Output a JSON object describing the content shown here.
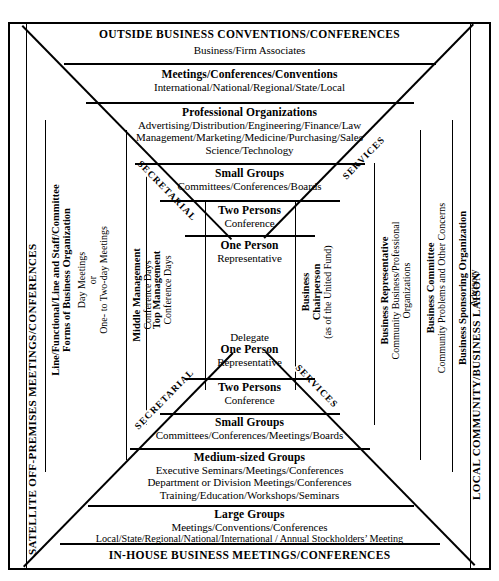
{
  "diagram": {
    "title_top": "OUTSIDE BUSINESS CONVENTIONS/CONFERENCES",
    "title_bottom": "IN-HOUSE BUSINESS MEETINGS/CONFERENCES",
    "side_left": "SATELLITE  OFF-PREMISES MEETINGS/CONFERENCES",
    "side_right": "LOCAL COMMUNITY/BUSINESS LAISON",
    "diagonal_labels": {
      "upper_left": "SECRETARIAL",
      "upper_right": "SERVICES",
      "lower_left": "SECRETARIAL",
      "lower_right": "SERVICES"
    },
    "top_tiers": [
      {
        "heading": "",
        "lines": [
          "Business/Firm  Associates"
        ]
      },
      {
        "heading": "Meetings/Conferences/Conventions",
        "lines": [
          "International/National/Regional/State/Local"
        ]
      },
      {
        "heading": "Professional Organizations",
        "lines": [
          "Advertising/Distribution/Engineering/Finance/Law",
          "Management/Marketing/Medicine/Purchasing/Sales",
          "Science/Technology"
        ]
      },
      {
        "heading": "Small Groups",
        "lines": [
          "Committees/Conferences/Boards"
        ]
      },
      {
        "heading": "Two Persons",
        "lines": [
          "Conference"
        ]
      },
      {
        "heading": "One Person",
        "lines": [
          "Representative"
        ]
      }
    ],
    "bottom_tiers": [
      {
        "heading": "One Person",
        "lines": [
          "Delegate",
          "Representative"
        ]
      },
      {
        "heading": "Two Persons",
        "lines": [
          "Conference"
        ]
      },
      {
        "heading": "Small Groups",
        "lines": [
          "Committees/Conferences/Meetings/Boards"
        ]
      },
      {
        "heading": "Medium-sized Groups",
        "lines": [
          "Executive Seminars/Meetings/Conferences",
          "Department or Division Meetings/Conferences",
          "Training/Education/Workshops/Seminars"
        ]
      },
      {
        "heading": "Large Groups",
        "lines": [
          "Meetings/Conventions/Conferences",
          "Local/State/Regional/National/International / Annual Stockholders’ Meeting"
        ]
      }
    ],
    "center_label": {
      "heading": "One Person",
      "above": "Delegate",
      "below": "Representative"
    },
    "left_columns": [
      {
        "bold": "Line/Functional/Line and Staff/Committee",
        "bold2": "Forms of Business Organization",
        "lines": [
          "Day Meetings",
          "or",
          "One- to Two-day Meetings"
        ]
      },
      {
        "bold": "Middle Management",
        "lines": [
          "Conference Days"
        ]
      },
      {
        "bold": "Top Management",
        "lines": [
          "Conference Days"
        ]
      }
    ],
    "right_columns": [
      {
        "bold": "Business",
        "bold2": "Chairperson",
        "lines": [
          "(as of the United Fund)"
        ]
      },
      {
        "bold": "Business Representative",
        "lines": [
          "Community Business/Professional",
          "Organizations"
        ]
      },
      {
        "bold": "Business Committee",
        "lines": [
          "Community Problems and Other Concerns"
        ]
      },
      {
        "bold": "Business Sponsoring Organization",
        "lines": [
          "Advisory"
        ]
      }
    ],
    "colors": {
      "ink": "#000000",
      "paper": "#ffffff"
    }
  }
}
